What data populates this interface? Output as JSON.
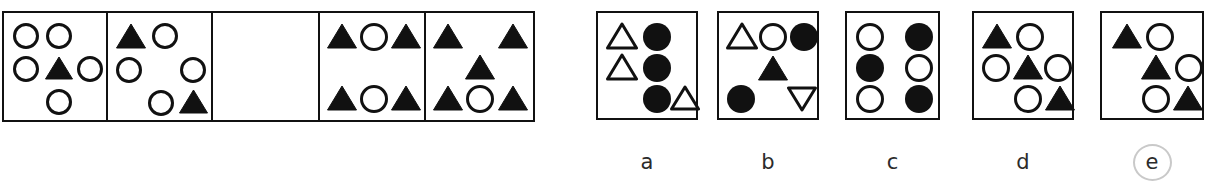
{
  "puzzle": {
    "type": "figure-series-completion",
    "stimulus": {
      "name": "sequence-strip",
      "cell_count": 5,
      "missing_cell_index": 2,
      "cells": [
        {
          "id": "cell-1",
          "empty": false,
          "shapes": [
            {
              "kind": "circle",
              "fill": "outline",
              "x": 9,
              "y": 10,
              "size": 26
            },
            {
              "kind": "circle",
              "fill": "outline",
              "x": 42,
              "y": 10,
              "size": 26
            },
            {
              "kind": "circle",
              "fill": "outline",
              "x": 9,
              "y": 43,
              "size": 26
            },
            {
              "kind": "triangle",
              "fill": "filled",
              "orientation": "up",
              "x": 40,
              "y": 42,
              "size": 30
            },
            {
              "kind": "circle",
              "fill": "outline",
              "x": 73,
              "y": 43,
              "size": 26
            },
            {
              "kind": "circle",
              "fill": "outline",
              "x": 42,
              "y": 76,
              "size": 26
            }
          ]
        },
        {
          "id": "cell-2",
          "empty": false,
          "shapes": [
            {
              "kind": "triangle",
              "fill": "filled",
              "orientation": "up",
              "x": 7,
              "y": 9,
              "size": 32
            },
            {
              "kind": "circle",
              "fill": "outline",
              "x": 44,
              "y": 10,
              "size": 26
            },
            {
              "kind": "circle",
              "fill": "outline",
              "x": 8,
              "y": 44,
              "size": 26
            },
            {
              "kind": "circle",
              "fill": "outline",
              "x": 72,
              "y": 44,
              "size": 26
            },
            {
              "kind": "circle",
              "fill": "outline",
              "x": 40,
              "y": 77,
              "size": 26
            },
            {
              "kind": "triangle",
              "fill": "filled",
              "orientation": "up",
              "x": 70,
              "y": 75,
              "size": 31
            }
          ]
        },
        {
          "id": "cell-3",
          "empty": true,
          "shapes": []
        },
        {
          "id": "cell-4",
          "empty": false,
          "shapes": [
            {
              "kind": "triangle",
              "fill": "filled",
              "orientation": "up",
              "x": 6,
              "y": 9,
              "size": 32
            },
            {
              "kind": "circle",
              "fill": "outline",
              "x": 40,
              "y": 10,
              "size": 28
            },
            {
              "kind": "triangle",
              "fill": "filled",
              "orientation": "up",
              "x": 70,
              "y": 9,
              "size": 32
            },
            {
              "kind": "triangle",
              "fill": "filled",
              "orientation": "up",
              "x": 6,
              "y": 71,
              "size": 32
            },
            {
              "kind": "circle",
              "fill": "outline",
              "x": 40,
              "y": 72,
              "size": 28
            },
            {
              "kind": "triangle",
              "fill": "filled",
              "orientation": "up",
              "x": 70,
              "y": 71,
              "size": 32
            }
          ]
        },
        {
          "id": "cell-5",
          "empty": false,
          "shapes": [
            {
              "kind": "triangle",
              "fill": "filled",
              "orientation": "up",
              "x": 6,
              "y": 9,
              "size": 32
            },
            {
              "kind": "triangle",
              "fill": "filled",
              "orientation": "up",
              "x": 71,
              "y": 9,
              "size": 32
            },
            {
              "kind": "triangle",
              "fill": "filled",
              "orientation": "up",
              "x": 38,
              "y": 40,
              "size": 32
            },
            {
              "kind": "triangle",
              "fill": "filled",
              "orientation": "up",
              "x": 6,
              "y": 71,
              "size": 32
            },
            {
              "kind": "circle",
              "fill": "outline",
              "x": 40,
              "y": 72,
              "size": 28
            },
            {
              "kind": "triangle",
              "fill": "filled",
              "orientation": "up",
              "x": 71,
              "y": 71,
              "size": 32
            }
          ]
        }
      ]
    },
    "options": [
      {
        "id": "option-a",
        "label": "a",
        "selected": false,
        "left": 2,
        "width": 102,
        "shapes": [
          {
            "kind": "triangle",
            "fill": "outline",
            "orientation": "up",
            "x": 8,
            "y": 9,
            "size": 32
          },
          {
            "kind": "circle",
            "fill": "filled",
            "x": 45,
            "y": 10,
            "size": 28
          },
          {
            "kind": "triangle",
            "fill": "outline",
            "orientation": "up",
            "x": 8,
            "y": 40,
            "size": 32
          },
          {
            "kind": "circle",
            "fill": "filled",
            "x": 45,
            "y": 41,
            "size": 28
          },
          {
            "kind": "circle",
            "fill": "filled",
            "x": 45,
            "y": 72,
            "size": 28
          },
          {
            "kind": "triangle",
            "fill": "outline",
            "orientation": "up",
            "x": 72,
            "y": 72,
            "size": 30
          }
        ]
      },
      {
        "id": "option-b",
        "label": "b",
        "selected": false,
        "left": 123,
        "width": 102,
        "shapes": [
          {
            "kind": "triangle",
            "fill": "outline",
            "orientation": "up",
            "x": 7,
            "y": 9,
            "size": 32
          },
          {
            "kind": "circle",
            "fill": "outline",
            "x": 40,
            "y": 10,
            "size": 28
          },
          {
            "kind": "circle",
            "fill": "filled",
            "x": 71,
            "y": 10,
            "size": 28
          },
          {
            "kind": "triangle",
            "fill": "filled",
            "orientation": "up",
            "x": 38,
            "y": 41,
            "size": 32
          },
          {
            "kind": "circle",
            "fill": "filled",
            "x": 8,
            "y": 72,
            "size": 28
          },
          {
            "kind": "triangle",
            "fill": "outline",
            "orientation": "down",
            "x": 68,
            "y": 73,
            "size": 30
          }
        ]
      },
      {
        "id": "option-c",
        "label": "c",
        "selected": false,
        "left": 251,
        "width": 95,
        "shapes": [
          {
            "kind": "circle",
            "fill": "outline",
            "x": 9,
            "y": 10,
            "size": 28
          },
          {
            "kind": "circle",
            "fill": "filled",
            "x": 58,
            "y": 10,
            "size": 28
          },
          {
            "kind": "circle",
            "fill": "filled",
            "x": 9,
            "y": 41,
            "size": 28
          },
          {
            "kind": "circle",
            "fill": "outline",
            "x": 58,
            "y": 41,
            "size": 28
          },
          {
            "kind": "circle",
            "fill": "outline",
            "x": 9,
            "y": 72,
            "size": 28
          },
          {
            "kind": "circle",
            "fill": "filled",
            "x": 58,
            "y": 72,
            "size": 28
          }
        ]
      },
      {
        "id": "option-d",
        "label": "d",
        "selected": false,
        "left": 378,
        "width": 102,
        "shapes": [
          {
            "kind": "triangle",
            "fill": "filled",
            "orientation": "up",
            "x": 7,
            "y": 9,
            "size": 32
          },
          {
            "kind": "circle",
            "fill": "outline",
            "x": 42,
            "y": 10,
            "size": 28
          },
          {
            "kind": "circle",
            "fill": "outline",
            "x": 8,
            "y": 41,
            "size": 28
          },
          {
            "kind": "triangle",
            "fill": "filled",
            "orientation": "up",
            "x": 38,
            "y": 40,
            "size": 32
          },
          {
            "kind": "circle",
            "fill": "outline",
            "x": 70,
            "y": 41,
            "size": 28
          },
          {
            "kind": "circle",
            "fill": "outline",
            "x": 40,
            "y": 72,
            "size": 28
          },
          {
            "kind": "triangle",
            "fill": "filled",
            "orientation": "up",
            "x": 70,
            "y": 71,
            "size": 32
          }
        ]
      },
      {
        "id": "option-e",
        "label": "e",
        "selected": true,
        "left": 506,
        "width": 104,
        "shapes": [
          {
            "kind": "triangle",
            "fill": "filled",
            "orientation": "up",
            "x": 9,
            "y": 9,
            "size": 32
          },
          {
            "kind": "circle",
            "fill": "outline",
            "x": 44,
            "y": 10,
            "size": 28
          },
          {
            "kind": "triangle",
            "fill": "filled",
            "orientation": "up",
            "x": 38,
            "y": 40,
            "size": 32
          },
          {
            "kind": "circle",
            "fill": "outline",
            "x": 73,
            "y": 41,
            "size": 28
          },
          {
            "kind": "circle",
            "fill": "outline",
            "x": 40,
            "y": 72,
            "size": 28
          },
          {
            "kind": "triangle",
            "fill": "filled",
            "orientation": "up",
            "x": 70,
            "y": 71,
            "size": 32
          }
        ]
      }
    ],
    "colors": {
      "ink": "#111111",
      "paper": "#ffffff",
      "selection_ring": "#c9c9c9",
      "label_text": "#2b2b2b"
    },
    "cell_widths": [
      104,
      105,
      107,
      106,
      109
    ]
  }
}
